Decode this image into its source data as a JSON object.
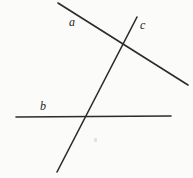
{
  "figure": {
    "background_color": "#fbfbfa",
    "stroke_color": "#2b2b2b",
    "width": 193,
    "height": 178,
    "labels": {
      "a": "a",
      "b": "b",
      "c": "c"
    },
    "lines": {
      "a": {
        "name": "a",
        "x1": 58,
        "y1": 3,
        "x2": 188,
        "y2": 85,
        "width": 1.6
      },
      "b": {
        "name": "b",
        "x1": 16,
        "y1": 117,
        "x2": 171,
        "y2": 116,
        "width": 1.6
      },
      "c": {
        "name": "c",
        "x1": 137,
        "y1": 17,
        "x2": 57,
        "y2": 172,
        "width": 1.6
      }
    },
    "intersections": {
      "a_c": {
        "x": 123,
        "y": 47
      },
      "b_c": {
        "x": 85,
        "y": 117
      }
    }
  }
}
